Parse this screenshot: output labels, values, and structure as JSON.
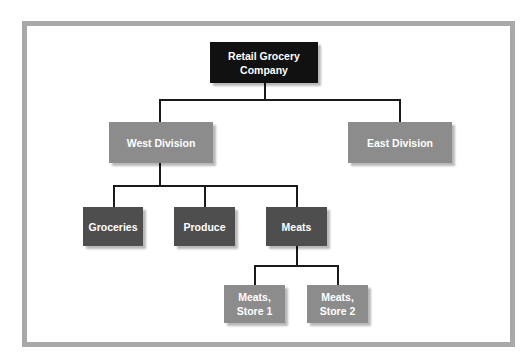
{
  "diagram": {
    "type": "org-chart",
    "root": {
      "id": "root",
      "label": "Retail Grocery\nCompany"
    },
    "divisions": [
      {
        "id": "west",
        "label": "West Division"
      },
      {
        "id": "east",
        "label": "East Division"
      }
    ],
    "departments": [
      {
        "id": "groceries",
        "label": "Groceries",
        "parent": "west"
      },
      {
        "id": "produce",
        "label": "Produce",
        "parent": "west"
      },
      {
        "id": "meats",
        "label": "Meats",
        "parent": "west"
      }
    ],
    "stores": [
      {
        "id": "meats-store-1",
        "label": "Meats,\nStore 1",
        "parent": "meats"
      },
      {
        "id": "meats-store-2",
        "label": "Meats,\nStore 2",
        "parent": "meats"
      }
    ],
    "colors": {
      "frame": "#a9a9a9",
      "root": "#111111",
      "division": "#8c8c8c",
      "department": "#4e4e4e",
      "store": "#8c8c8c",
      "connector": "#1a1a1a"
    }
  }
}
